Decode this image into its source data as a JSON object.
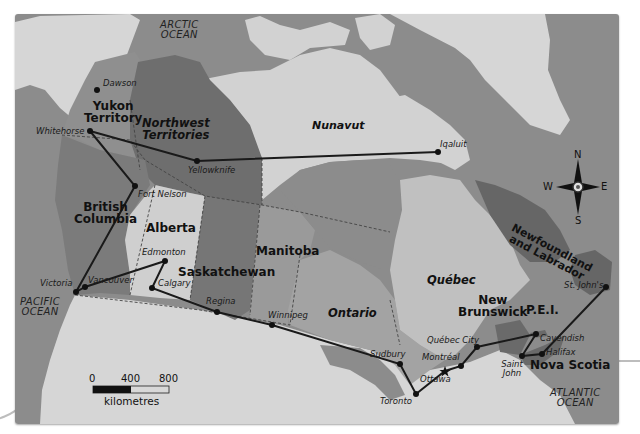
{
  "map": {
    "title": "",
    "colors": {
      "water": "#8c8c8c",
      "frame_shadow": "#777777",
      "foreign_land": "#d6d6d6",
      "nunavut": "#d2d2d2",
      "yukon": "#8f8f8f",
      "nwt": "#6e6e6e",
      "bc": "#7b7b7b",
      "alberta": "#cfcfcf",
      "saskatchewan": "#767676",
      "manitoba": "#9a9a9a",
      "ontario": "#a3a3a3",
      "quebec": "#c0c0c0",
      "newfoundland": "#666666",
      "maritimes": "#6a6a6a",
      "route": "#1a1a1a"
    },
    "oceans": [
      {
        "id": "arctic",
        "line1": "ARCTIC",
        "line2": "OCEAN"
      },
      {
        "id": "pacific",
        "line1": "PACIFIC",
        "line2": "OCEAN"
      },
      {
        "id": "atlantic",
        "line1": "ATLANTIC",
        "line2": "OCEAN"
      }
    ],
    "regions": [
      {
        "id": "yukon",
        "line1": "Yukon",
        "line2": "Territory"
      },
      {
        "id": "nwt",
        "line1": "Northwest",
        "line2": "Territories"
      },
      {
        "id": "nunavut",
        "line1": "Nunavut"
      },
      {
        "id": "bc",
        "line1": "British",
        "line2": "Columbia"
      },
      {
        "id": "alberta",
        "line1": "Alberta"
      },
      {
        "id": "saskatchewan",
        "line1": "Saskatchewan"
      },
      {
        "id": "manitoba",
        "line1": "Manitoba"
      },
      {
        "id": "ontario",
        "line1": "Ontario"
      },
      {
        "id": "quebec",
        "line1": "Québec"
      },
      {
        "id": "nb",
        "line1": "New",
        "line2": "Brunswick"
      },
      {
        "id": "pei",
        "line1": "P.E.I."
      },
      {
        "id": "ns",
        "line1": "Nova Scotia"
      },
      {
        "id": "nl",
        "line1": "Newfoundland",
        "line2": "and Labrador"
      }
    ],
    "cities": [
      {
        "name": "Dawson",
        "x": 97,
        "y": 90
      },
      {
        "name": "Whitehorse",
        "x": 90,
        "y": 131
      },
      {
        "name": "Yellowknife",
        "x": 197,
        "y": 161
      },
      {
        "name": "Iqaluit",
        "x": 438,
        "y": 152
      },
      {
        "name": "Fort Nelson",
        "x": 135,
        "y": 186
      },
      {
        "name": "Edmonton",
        "x": 165,
        "y": 261
      },
      {
        "name": "Calgary",
        "x": 152,
        "y": 288
      },
      {
        "name": "Vancouver",
        "x": 85,
        "y": 287
      },
      {
        "name": "Victoria",
        "x": 76,
        "y": 292
      },
      {
        "name": "Regina",
        "x": 217,
        "y": 312
      },
      {
        "name": "Winnipeg",
        "x": 272,
        "y": 325
      },
      {
        "name": "Sudbury",
        "x": 400,
        "y": 364
      },
      {
        "name": "Toronto",
        "x": 416,
        "y": 394
      },
      {
        "name": "Ottawa",
        "x": 445,
        "y": 371
      },
      {
        "name": "Montréal",
        "x": 461,
        "y": 366
      },
      {
        "name": "Québec City",
        "x": 477,
        "y": 347
      },
      {
        "name": "Saint John",
        "x": 522,
        "y": 356
      },
      {
        "name": "Cavendish",
        "x": 536,
        "y": 334
      },
      {
        "name": "Halifax",
        "x": 542,
        "y": 354
      },
      {
        "name": "St. John's",
        "x": 606,
        "y": 287
      }
    ],
    "route": [
      "Whitehorse",
      "Fort Nelson",
      "Victoria",
      "Vancouver",
      "Edmonton",
      "Calgary",
      "Regina",
      "Winnipeg",
      "Sudbury",
      "Toronto",
      "Ottawa",
      "Montréal",
      "Québec City",
      "Cavendish",
      "Saint John",
      "Halifax",
      "St. John's"
    ],
    "route_branch": [
      "Whitehorse",
      "Yellowknife",
      "Iqaluit"
    ],
    "capital_marker": "Ottawa",
    "compass": {
      "n": "N",
      "s": "S",
      "e": "E",
      "w": "W"
    },
    "scale": {
      "ticks": [
        "0",
        "400",
        "800"
      ],
      "unit": "kilometres"
    }
  }
}
